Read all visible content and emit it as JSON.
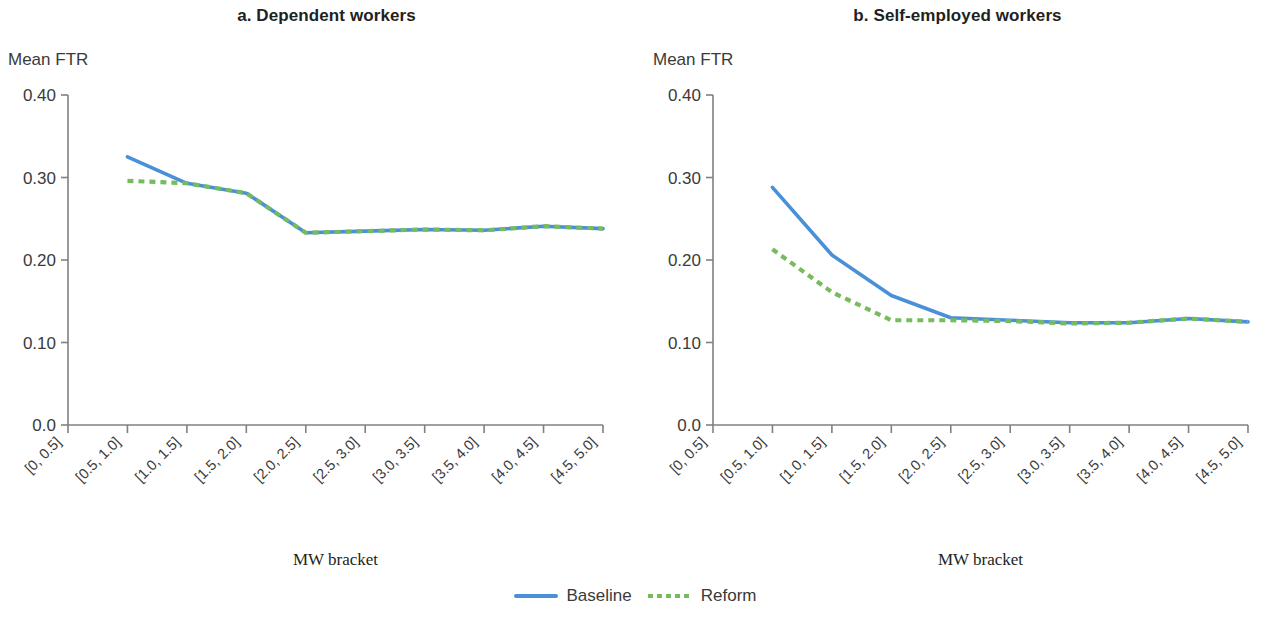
{
  "figure": {
    "legend": {
      "items": [
        {
          "label": "Baseline",
          "style": "solid",
          "color": "#4a90d9"
        },
        {
          "label": "Reform",
          "style": "dotted",
          "color": "#76bc5e"
        }
      ]
    }
  },
  "chart_data": [
    {
      "type": "line",
      "panel": "a",
      "title": "a. Dependent workers",
      "ylabel": "Mean FTR",
      "xlabel": "MW bracket",
      "categories": [
        "[0, 0.5]",
        "[0.5, 1.0]",
        "[1.0, 1.5]",
        "[1.5, 2.0]",
        "[2.0, 2.5]",
        "[2.5, 3.0]",
        "[3.0, 3.5]",
        "[3.5, 4.0]",
        "[4.0, 4.5]",
        "[4.5, 5.0]"
      ],
      "ylim": [
        0.0,
        0.4
      ],
      "yticks": [
        0.0,
        0.1,
        0.2,
        0.3,
        0.4
      ],
      "ytick_labels": [
        "0.0",
        "0.10",
        "0.20",
        "0.30",
        "0.40"
      ],
      "grid": false,
      "legend_position": "bottom-center",
      "series": [
        {
          "name": "Baseline",
          "color": "#4a90d9",
          "style": "solid",
          "values": [
            null,
            0.325,
            0.293,
            0.281,
            0.233,
            0.235,
            0.237,
            0.236,
            0.241,
            0.238
          ]
        },
        {
          "name": "Reform",
          "color": "#76bc5e",
          "style": "dotted",
          "values": [
            null,
            0.296,
            0.293,
            0.281,
            0.233,
            0.235,
            0.237,
            0.236,
            0.241,
            0.238
          ]
        }
      ]
    },
    {
      "type": "line",
      "panel": "b",
      "title": "b. Self-employed workers",
      "ylabel": "Mean FTR",
      "xlabel": "MW bracket",
      "categories": [
        "[0, 0.5]",
        "[0.5, 1.0]",
        "[1.0, 1.5]",
        "[1.5, 2.0]",
        "[2.0, 2.5]",
        "[2.5, 3.0]",
        "[3.0, 3.5]",
        "[3.5, 4.0]",
        "[4.0, 4.5]",
        "[4.5, 5.0]"
      ],
      "ylim": [
        0.0,
        0.4
      ],
      "yticks": [
        0.0,
        0.1,
        0.2,
        0.3,
        0.4
      ],
      "ytick_labels": [
        "0.0",
        "0.10",
        "0.20",
        "0.30",
        "0.40"
      ],
      "grid": false,
      "legend_position": "bottom-center",
      "series": [
        {
          "name": "Baseline",
          "color": "#4a90d9",
          "style": "solid",
          "values": [
            null,
            0.288,
            0.206,
            0.157,
            0.13,
            0.127,
            0.124,
            0.124,
            0.129,
            0.125
          ]
        },
        {
          "name": "Reform",
          "color": "#76bc5e",
          "style": "dotted",
          "values": [
            null,
            0.213,
            0.161,
            0.127,
            0.127,
            0.126,
            0.123,
            0.124,
            0.129,
            0.125
          ]
        }
      ]
    }
  ]
}
